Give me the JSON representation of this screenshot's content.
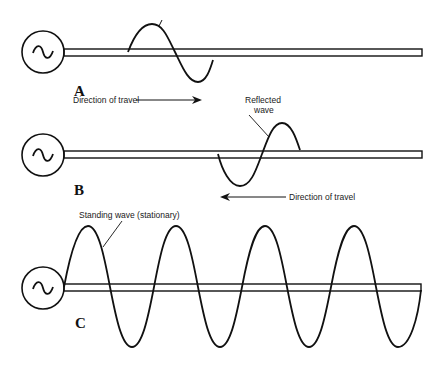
{
  "figure": {
    "type": "transmission-line-wave-diagram",
    "panels": [
      {
        "id": "A",
        "label": "A",
        "direction_label": "Direction of travel",
        "direction": "right",
        "wave": "incident"
      },
      {
        "id": "B",
        "label": "B",
        "callout": "Reflected wave",
        "callout_line1": "Reflected",
        "callout_line2": "wave",
        "direction_label": "Direction of travel",
        "direction": "left",
        "wave": "reflected"
      },
      {
        "id": "C",
        "label": "C",
        "callout": "Standing wave (stationary)",
        "wave": "standing",
        "peaks": 4,
        "troughs": 4
      }
    ],
    "source_symbol": "~",
    "colors": {
      "ink": "#111111",
      "background": "#ffffff"
    }
  }
}
